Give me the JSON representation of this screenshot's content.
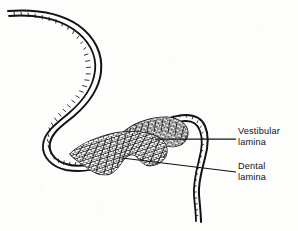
{
  "figure": {
    "background_color": "#fdfdfc",
    "ink_color": "#111111",
    "type": "line-drawing-histology",
    "width": 298,
    "height": 231
  },
  "labels": [
    {
      "id": "vestibular-lamina",
      "line1": "Vestibular",
      "line2": "lamina",
      "x": 238,
      "y": 126,
      "leader": {
        "from_x": 155,
        "from_y": 139,
        "to_x": 236,
        "to_y": 139
      }
    },
    {
      "id": "dental-lamina",
      "line1": "Dental",
      "line2": "lamina",
      "x": 238,
      "y": 161,
      "leader": {
        "from_x": 122,
        "from_y": 158,
        "to_x": 236,
        "to_y": 172
      }
    }
  ],
  "structures": {
    "oral_epithelium": "oral epithelial band with stratified cell outlines",
    "vestibular_lamina_mass": "thickened epithelial cell mass, upper right of bulge",
    "dental_lamina_mass": "thickened epithelial cell mass, lower left of bulge"
  }
}
